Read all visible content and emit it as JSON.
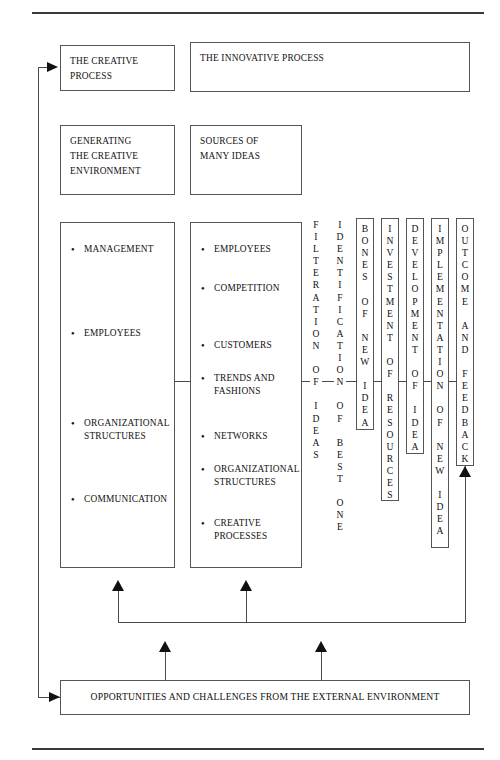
{
  "diagram": {
    "top_rule": true,
    "bottom_rule": true,
    "boxes": {
      "creative_process": "THE CREATIVE\nPROCESS",
      "innovative_process": "THE INNOVATIVE PROCESS",
      "generating_environment": "GENERATING\nTHE CREATIVE\nENVIRONMENT",
      "sources_of_ideas": "SOURCES OF\nMANY IDEAS",
      "external_environment": "OPPORTUNITIES AND CHALLENGES FROM THE EXTERNAL ENVIRONMENT"
    },
    "creative_environment_items": [
      "MANAGEMENT",
      "EMPLOYEES",
      "ORGANIZATIONAL\nSTRUCTURES",
      "COMMUNICATION"
    ],
    "idea_sources_items": [
      "EMPLOYEES",
      "COMPETITION",
      "CUSTOMERS",
      "TRENDS AND\nFASHIONS",
      "NETWORKS",
      "ORGANIZATIONAL\nSTRUCTURES",
      "CREATIVE\nPROCESSES"
    ],
    "stages": [
      {
        "id": "filteration",
        "text": "F\nI\nL\nT\nE\nR\nA\nT\nI\nO\nN\n\nO\nF\n\nI\nD\nE\nA\nS",
        "boxed": false
      },
      {
        "id": "identification",
        "text": "I\nD\nE\nN\nT\nI\nF\nI\nC\nA\nT\nI\nO\nN\n\nO\nF\n\nB\nE\nS\nT\n\nO\nN\nE",
        "boxed": false
      },
      {
        "id": "bones-of-new-idea",
        "text": "B\nO\nN\nE\nS\n\nO\nF\n\nN\nE\nW\n\nI\nD\nE\nA",
        "boxed": true
      },
      {
        "id": "investment-of-resources",
        "text": "I\nN\nV\nE\nS\nT\nM\nE\nN\nT\n\nO\nF\n\nR\nE\nS\nO\nU\nR\nC\nE\nS",
        "boxed": true
      },
      {
        "id": "development-of-idea",
        "text": "D\nE\nV\nE\nL\nO\nP\nM\nE\nN\nT\n\nO\nF\n\nI\nD\nE\nA",
        "boxed": true
      },
      {
        "id": "implementation-of-new-idea",
        "text": "I\nM\nP\nL\nE\nM\nE\nN\nT\nA\nT\nI\nO\nN\n\nO\nF\n\nN\nE\nW\n\nI\nD\nE\nA",
        "boxed": true
      },
      {
        "id": "outcome-and-feedback",
        "text": "O\nU\nT\nC\nO\nM\nE\n\nA\nN\nD\n\nF\nE\nE\nD\nB\nA\nC\nK",
        "boxed": true
      }
    ],
    "colors": {
      "line": "#4a4a4a",
      "rule": "#3a3a3a",
      "arrow": "#111111",
      "text": "#111111",
      "background": "#ffffff"
    }
  }
}
